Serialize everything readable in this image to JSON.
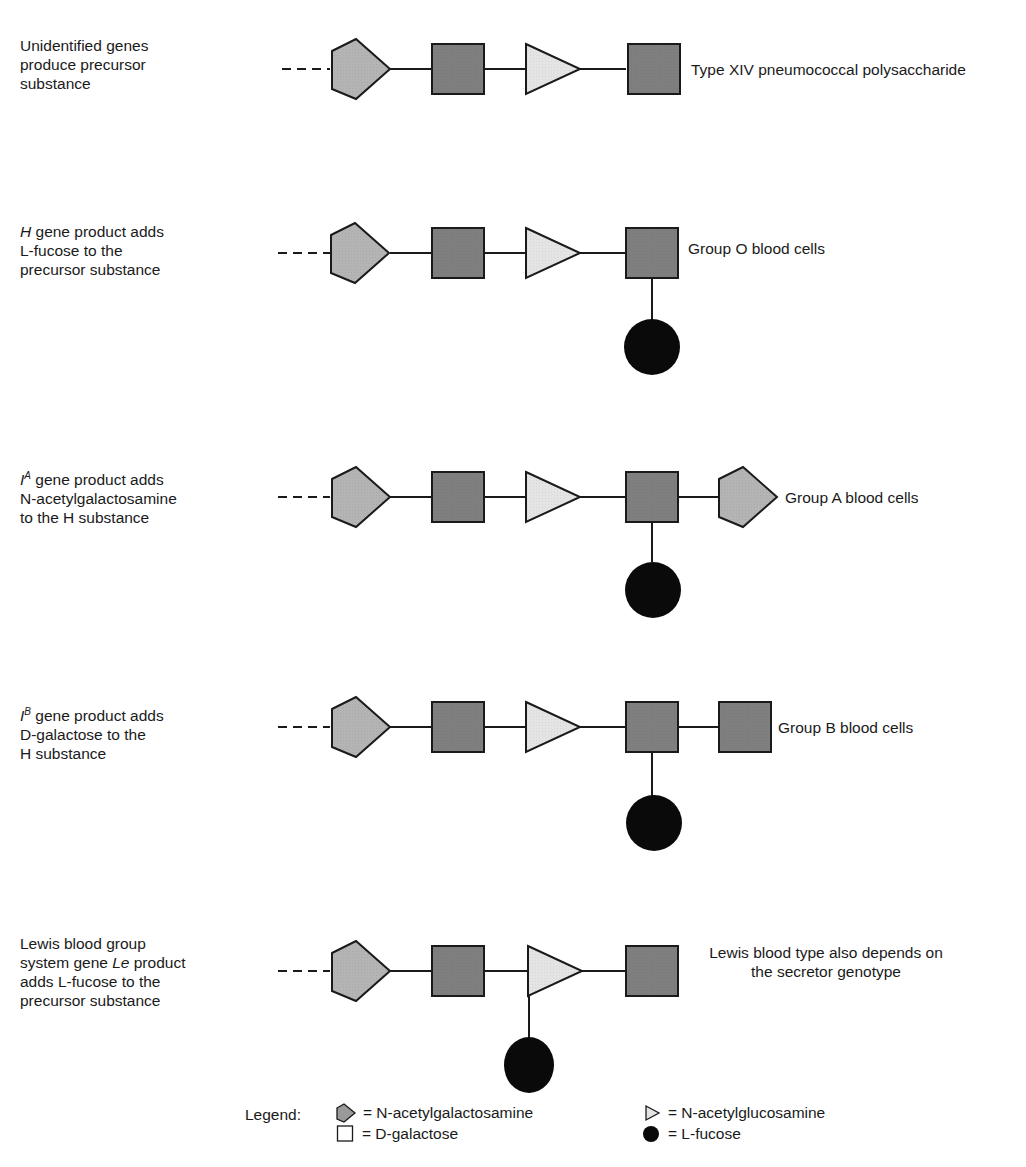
{
  "colors": {
    "galnac": "#b4b4b4",
    "galactose": "#7f7f7f",
    "glcnac": "#e4e4e4",
    "fucose": "#0a0a0a",
    "stroke": "#1a1a1a"
  },
  "rows": [
    {
      "id": "precursor",
      "description": [
        "Unidentified genes",
        "produce precursor",
        "substance"
      ],
      "result_label": "Type XIV pneumococcal polysaccharide",
      "chain": [
        "N-acetylgalactosamine",
        "D-galactose",
        "N-acetylglucosamine",
        "D-galactose"
      ],
      "branches": []
    },
    {
      "id": "group-o",
      "description_parts": [
        {
          "gene": "H",
          "rest": " gene product adds"
        },
        "L-fucose to the",
        "precursor substance"
      ],
      "result_label": "Group O blood cells",
      "chain": [
        "N-acetylgalactosamine",
        "D-galactose",
        "N-acetylglucosamine",
        "D-galactose"
      ],
      "branches": [
        {
          "attached_to": "D-galactose (terminal)",
          "sugar": "L-fucose"
        }
      ]
    },
    {
      "id": "group-a",
      "description_parts": [
        {
          "gene": "I",
          "sup": "A",
          "rest": " gene product adds"
        },
        "N-acetylgalactosamine",
        "to the H substance"
      ],
      "result_label": "Group A blood cells",
      "chain": [
        "N-acetylgalactosamine",
        "D-galactose",
        "N-acetylglucosamine",
        "D-galactose",
        "N-acetylgalactosamine"
      ],
      "branches": [
        {
          "attached_to": "D-galactose (4th)",
          "sugar": "L-fucose"
        }
      ]
    },
    {
      "id": "group-b",
      "description_parts": [
        {
          "gene": "I",
          "sup": "B",
          "rest": " gene product adds"
        },
        "D-galactose to the",
        "H substance"
      ],
      "result_label": "Group B blood cells",
      "chain": [
        "N-acetylgalactosamine",
        "D-galactose",
        "N-acetylglucosamine",
        "D-galactose",
        "D-galactose"
      ],
      "branches": [
        {
          "attached_to": "D-galactose (4th)",
          "sugar": "L-fucose"
        }
      ]
    },
    {
      "id": "lewis",
      "description_parts": [
        "Lewis blood group",
        {
          "pre": "system gene ",
          "gene": "Le",
          "rest": " product"
        },
        "adds L-fucose to the",
        "precursor substance"
      ],
      "result_label": [
        "Lewis blood type also depends on",
        "the secretor genotype"
      ],
      "chain": [
        "N-acetylgalactosamine",
        "D-galactose",
        "N-acetylglucosamine",
        "D-galactose"
      ],
      "branches": [
        {
          "attached_to": "N-acetylglucosamine",
          "sugar": "L-fucose"
        }
      ]
    }
  ],
  "legend": {
    "title": "Legend:",
    "items": [
      {
        "shape": "pentagon",
        "symbol": "pentagon-icon",
        "label": "= N-acetylgalactosamine"
      },
      {
        "shape": "square",
        "symbol": "square-icon",
        "label": "= D-galactose"
      },
      {
        "shape": "triangle",
        "symbol": "triangle-icon",
        "label": "= N-acetylglucosamine"
      },
      {
        "shape": "circle",
        "symbol": "circle-icon",
        "label": "= L-fucose"
      }
    ]
  },
  "text": {
    "r0": {
      "l1": "Unidentified genes",
      "l2": "produce precursor",
      "l3": "substance",
      "result": "Type XIV pneumococcal polysaccharide"
    },
    "r1": {
      "gene": "H",
      "l1rest": " gene product adds",
      "l2": "L-fucose to the",
      "l3": "precursor substance",
      "result": "Group O blood cells"
    },
    "r2": {
      "gene": "I",
      "sup": "A",
      "l1rest": " gene product adds",
      "l2": "N-acetylgalactosamine",
      "l3": "to the H substance",
      "result": "Group A blood cells"
    },
    "r3": {
      "gene": "I",
      "sup": "B",
      "l1rest": " gene product adds",
      "l2": "D-galactose to the",
      "l3": "H substance",
      "result": "Group B blood cells"
    },
    "r4": {
      "l1": "Lewis blood group",
      "l2pre": "system gene ",
      "gene": "Le",
      "l2rest": " product",
      "l3": "adds L-fucose to the",
      "l4": "precursor substance",
      "result1": "Lewis blood type also depends on",
      "result2": "the secretor genotype"
    }
  }
}
